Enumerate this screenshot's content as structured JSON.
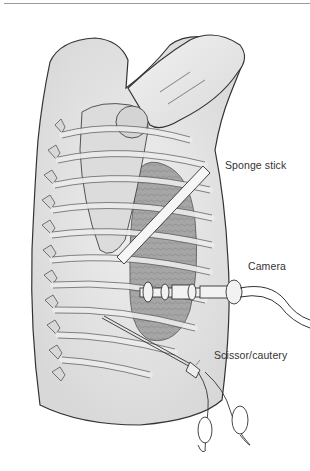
{
  "figure": {
    "labels": {
      "sponge_stick": "Sponge stick",
      "camera": "Camera",
      "scissor_cautery": "Scissor/cautery"
    },
    "colors": {
      "background": "#ffffff",
      "outline": "#333333",
      "skin": "#e6e6e6",
      "bone": "#d6d6d6",
      "lung": "#9a9a9a",
      "instrument": "#f4f4f4"
    }
  }
}
